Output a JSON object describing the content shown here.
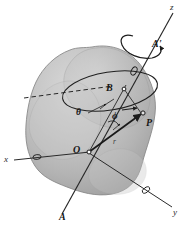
{
  "figure": {
    "background_color": "#ffffff",
    "body_fill_color": "#b9b9b9",
    "body_outline_color": "#7a7a7a",
    "line_color": "#2a2a2a",
    "label_color": "#161616"
  },
  "axes": [
    {
      "key": "x",
      "label": "x",
      "description": "x-axis pointing to lower left"
    },
    {
      "key": "y",
      "label": "y",
      "description": "y-axis pointing to lower right"
    },
    {
      "key": "z",
      "label": "z",
      "description": "z-axis pointing to upper right"
    }
  ],
  "points": [
    {
      "key": "O",
      "label": "O",
      "description": "origin at center of body"
    },
    {
      "key": "B",
      "label": "B",
      "description": "point on the rotation axis"
    },
    {
      "key": "P",
      "label": "P",
      "description": "particle located by radius vector r"
    }
  ],
  "rotation_axis": [
    {
      "key": "A",
      "label": "A",
      "description": "lower end of rotation axis"
    },
    {
      "key": "Aprime",
      "label": "A'",
      "description": "upper end of rotation axis"
    }
  ],
  "angles": [
    {
      "key": "theta",
      "label": "θ",
      "description": "polar angle measured from axis"
    },
    {
      "key": "phi",
      "label": "ϕ",
      "description": "angle between r and axis OB"
    }
  ],
  "vectors": [
    {
      "key": "r",
      "label": "r",
      "description": "position vector from O to P"
    }
  ],
  "annotations": {
    "spin_arrow": "curved arrow indicating rotation about the z-axis",
    "circle_arrow": "arrow on the circular path traced by P",
    "dashed_line": "dashed reference line through the circular path"
  }
}
